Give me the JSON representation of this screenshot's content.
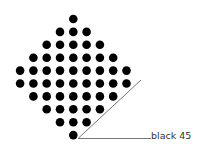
{
  "diagram": {
    "shape": "diamond dot grid",
    "row_counts": [
      1,
      3,
      5,
      7,
      9,
      9,
      7,
      5,
      3,
      1
    ],
    "dot_color": "#000000",
    "dot_radius": 4.3,
    "center_x": 73.3,
    "top_y": 19,
    "row_spacing": 12.9,
    "col_spacing": 13.3,
    "line_color": "#666666",
    "pointer": {
      "vertex": [
        78,
        138.5
      ],
      "diagonal_end": [
        141,
        80
      ],
      "horizontal_end": [
        151,
        138.5
      ]
    },
    "label": "black 45"
  }
}
